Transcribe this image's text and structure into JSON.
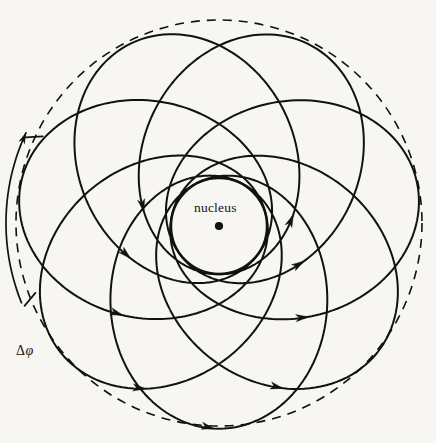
{
  "figure": {
    "type": "orbit-diagram",
    "title_visible": false,
    "background_color": "#f7f6f3",
    "stroke_color": "#111111",
    "width": 436,
    "height": 443
  },
  "labels": {
    "nucleus": "nucleus",
    "precession_delta": "Δ",
    "precession_phi": "φ"
  },
  "nucleus_marker": {
    "cx": 219,
    "cy": 226,
    "r": 4.1,
    "color": "#111111"
  },
  "inner_circle": {
    "name": "perihelion-circle",
    "cx": 219,
    "cy": 226,
    "r": 48,
    "dashed": false,
    "stroke_width": 2.4
  },
  "outer_circle": {
    "name": "aphelion-circle",
    "cx": 219,
    "cy": 223,
    "r": 203,
    "dashed": true,
    "dash_pattern": "9 7",
    "stroke_width": 1.6
  },
  "orbit": {
    "name": "precessing-kepler-rosette",
    "semi_major": 125.5,
    "eccentricity": 0.615,
    "perihelion_radius": 48,
    "aphelion_radius": 203,
    "lobes": 7,
    "precession_per_orbit_deg": 51.4,
    "direction": "counterclockwise",
    "start_angle_deg": 90,
    "stroke_width": 2.0,
    "arrow_count": 15
  },
  "precession_arc": {
    "name": "delta-phi-arc",
    "radius": 213,
    "start_angle_deg": 158,
    "end_angle_deg": 205,
    "tick_angles_deg": [
      158,
      205
    ],
    "tick_length": 17,
    "arrow_at": "end",
    "stroke_width": 1.7
  },
  "chart_data": {
    "type": "scatter",
    "xlabel": "",
    "ylabel": "",
    "legend": [],
    "annotations": [
      {
        "text": "nucleus",
        "x": 219,
        "y": 208
      },
      {
        "text": "Δφ",
        "x": 29,
        "y": 352
      }
    ],
    "series": [
      {
        "name": "rosette-orbit",
        "description": "Kepler ellipse precessing by 51.4 degrees per revolution, 7 lobes",
        "perihelion": 48,
        "aphelion": 203,
        "eccentricity": 0.615
      },
      {
        "name": "perihelion-envelope",
        "description": "solid inner circle of radius 48 touched at every perihelion"
      },
      {
        "name": "aphelion-envelope",
        "description": "dashed outer circle of radius 203 touched at every aphelion"
      }
    ]
  }
}
